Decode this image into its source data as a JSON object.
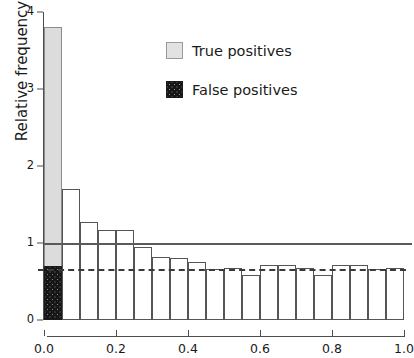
{
  "chart_data": {
    "type": "bar",
    "title": "",
    "subtitle": "",
    "xlabel": "",
    "ylabel": "Relative frequency",
    "xlim": [
      0.0,
      1.0
    ],
    "ylim": [
      0,
      4
    ],
    "grid": false,
    "bin_width": 0.05,
    "bin_edges": [
      0.0,
      0.05,
      0.1,
      0.15,
      0.2,
      0.25,
      0.3,
      0.35,
      0.4,
      0.45,
      0.5,
      0.55,
      0.6,
      0.65,
      0.7,
      0.75,
      0.8,
      0.85,
      0.9,
      0.95,
      1.0
    ],
    "categories": [
      "0.00-0.05",
      "0.05-0.10",
      "0.10-0.15",
      "0.15-0.20",
      "0.20-0.25",
      "0.25-0.30",
      "0.30-0.35",
      "0.35-0.40",
      "0.40-0.45",
      "0.45-0.50",
      "0.50-0.55",
      "0.55-0.60",
      "0.60-0.65",
      "0.65-0.70",
      "0.70-0.75",
      "0.75-0.80",
      "0.80-0.85",
      "0.85-0.90",
      "0.90-0.95",
      "0.95-1.00"
    ],
    "series": [
      {
        "name": "True positives",
        "color": "#dcdcdc",
        "values": [
          3.8,
          1.7,
          1.27,
          1.17,
          1.17,
          0.95,
          0.82,
          0.8,
          0.75,
          0.66,
          0.68,
          0.58,
          0.72,
          0.72,
          0.68,
          0.58,
          0.72,
          0.72,
          0.66,
          0.68
        ]
      },
      {
        "name": "False positives",
        "color": "#161616",
        "values": [
          0.7,
          0.0,
          0.0,
          0.0,
          0.0,
          0.0,
          0.0,
          0.0,
          0.0,
          0.0,
          0.0,
          0.0,
          0.0,
          0.0,
          0.0,
          0.0,
          0.0,
          0.0,
          0.0,
          0.0
        ]
      }
    ],
    "y_ticks": [
      0,
      1,
      2,
      3,
      4
    ],
    "y_tick_labels": [
      "0",
      "1",
      "2",
      "3",
      "4"
    ],
    "x_ticks": [
      0.0,
      0.2,
      0.4,
      0.6,
      0.8,
      1.0
    ],
    "x_tick_labels": [
      "0.0",
      "0.2",
      "0.4",
      "0.6",
      "0.8",
      "1.0"
    ],
    "reference_lines": [
      {
        "name": "unity-line",
        "value": 1.0,
        "style": "solid",
        "color": "#5a5a5a"
      },
      {
        "name": "threshold-line",
        "value": 0.66,
        "style": "dashed",
        "color": "#3a3a3a"
      }
    ],
    "legend": {
      "position": "upper-center",
      "entries": [
        {
          "label": "True positives",
          "swatch": "light-square"
        },
        {
          "label": "False positives",
          "swatch": "dark-dotted-square"
        }
      ]
    }
  }
}
